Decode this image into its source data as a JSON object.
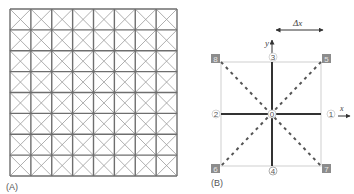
{
  "panels": {
    "A": {
      "label": "(A)",
      "grid": {
        "rows": 8,
        "cols": 8,
        "cell_diagonals": true
      }
    },
    "B": {
      "label": "(B)",
      "delta_label": "Δx",
      "axis_x": "x",
      "axis_y": "y",
      "center_node": "0",
      "nodes": {
        "n1": "1",
        "n2": "2",
        "n3": "3",
        "n4": "4",
        "n5": "5",
        "n6": "6",
        "n7": "7",
        "n8": "8"
      }
    }
  },
  "colors": {
    "grid_line": "#6e6e6e",
    "diag_line": "#9a9a9a",
    "solid_axis": "#333333",
    "dashed": "#555555",
    "box": "#cfcfcf",
    "corner_node_fill": "#8c8c8c"
  }
}
